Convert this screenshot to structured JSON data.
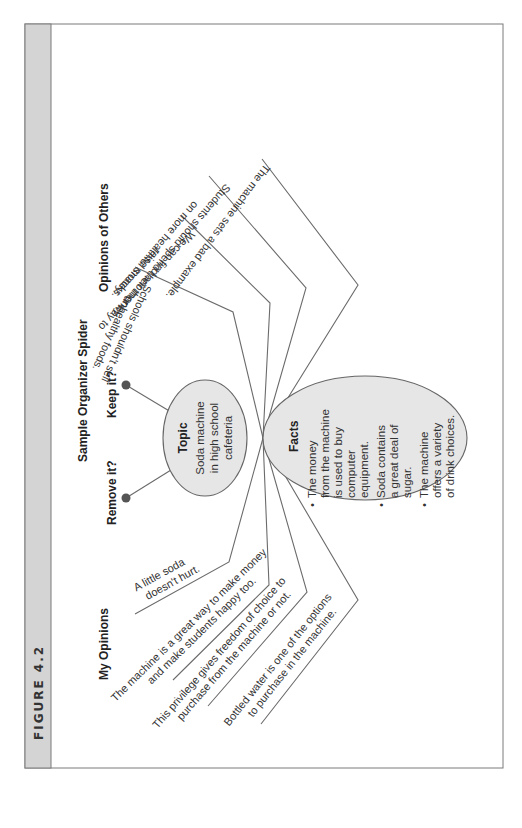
{
  "figure": {
    "label": "FIGURE 4.2",
    "title": "Sample Organizer Spider"
  },
  "topic": {
    "title": "Topic",
    "lines": [
      "Soda machine",
      "in high school",
      "cafeteria"
    ]
  },
  "questions": {
    "keep": "Keep it?",
    "remove": "Remove it?"
  },
  "facts": {
    "title": "Facts",
    "bullets": [
      [
        "The money",
        "from the machine",
        "is used to buy",
        "computer",
        "equipment."
      ],
      [
        "Soda contains",
        "a great deal of",
        "sugar."
      ],
      [
        "The machine",
        "offers a variety",
        "of drink choices."
      ]
    ]
  },
  "my_opinions": {
    "heading": "My Opinions",
    "items": [
      [
        "A little soda",
        "doesn't hurt."
      ],
      [
        "The machine is a great way to make money",
        "and make students happy too."
      ],
      [
        "This privilege gives freedom of choice to",
        "purchase from the machine or not."
      ],
      [
        "Bottled water is one of the options",
        "to purchase in the machine."
      ]
    ]
  },
  "opinions_of_others": {
    "heading": "Opinions of Others",
    "items": [
      [
        "Schools shouldn't sell",
        "unhealthy foods."
      ],
      [
        "We can find another way to",
        "raise money."
      ],
      [
        "Students should spend their money",
        "on more healthful snacks."
      ],
      [
        "The machine sets a bad example."
      ]
    ]
  },
  "colors": {
    "sidebar": "#d4d4d4",
    "node_fill": "#e6e6e6",
    "line": "#6b6b6b",
    "dot": "#555555",
    "frame": "#7a7a7a"
  }
}
